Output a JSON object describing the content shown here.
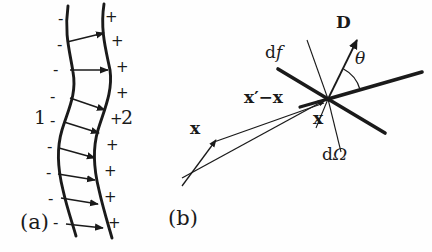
{
  "figure": {
    "background_color": "#fefefe",
    "ink_color": "#1a1a1a",
    "panels": [
      {
        "tag": "(a)",
        "description": "wavy-interface-with-polarization-arrows",
        "left_region_label": "1",
        "right_region_label": "2",
        "left_signs": [
          "-",
          "-",
          "-",
          "-",
          "-",
          "-",
          "-",
          "-",
          "-"
        ],
        "right_signs": [
          "+",
          "+",
          "+",
          "+",
          "+",
          "+",
          "+",
          "+",
          "+"
        ]
      },
      {
        "tag": "(b)",
        "description": "scattering-geometry-at-a-point",
        "labels": {
          "D": "D",
          "theta": "θ",
          "df": "d",
          "df_italic": "f",
          "dOmega": "d",
          "dOmega_sym": "Ω",
          "x_prime_minus_x": "x′−x",
          "x_at_point": "x",
          "x_source": "x"
        }
      }
    ]
  },
  "panel_a": {
    "tag": "(a)",
    "region_left": "1",
    "region_right": "2",
    "minus_sign": "-",
    "plus_sign": "+",
    "minus_positions": [
      {
        "x": 58,
        "y": 12
      },
      {
        "x": 57,
        "y": 38
      },
      {
        "x": 53,
        "y": 63
      },
      {
        "x": 50,
        "y": 90
      },
      {
        "x": 50,
        "y": 114
      },
      {
        "x": 47,
        "y": 140
      },
      {
        "x": 46,
        "y": 166
      },
      {
        "x": 48,
        "y": 192
      },
      {
        "x": 53,
        "y": 216
      }
    ],
    "plus_positions": [
      {
        "x": 105,
        "y": 10
      },
      {
        "x": 111,
        "y": 34
      },
      {
        "x": 116,
        "y": 60
      },
      {
        "x": 116,
        "y": 86
      },
      {
        "x": 110,
        "y": 112
      },
      {
        "x": 106,
        "y": 138
      },
      {
        "x": 104,
        "y": 164
      },
      {
        "x": 104,
        "y": 190
      },
      {
        "x": 108,
        "y": 216
      }
    ],
    "num1_position": {
      "x": 34,
      "y": 108
    },
    "num2_position": {
      "x": 121,
      "y": 108
    },
    "tag_position": {
      "x": 20,
      "y": 212
    }
  },
  "panel_b": {
    "tag": "(b)",
    "tag_position": {
      "x": 168,
      "y": 208
    },
    "vertex": {
      "x": 328,
      "y": 99
    },
    "label_D": "D",
    "label_D_position": {
      "x": 336,
      "y": 14
    },
    "label_theta": "θ",
    "label_theta_position": {
      "x": 355,
      "y": 50
    },
    "label_df_d": "d",
    "label_df_f": "f",
    "label_df_position": {
      "x": 265,
      "y": 44
    },
    "label_dOmega_d": "d",
    "label_dOmega_omega": "Ω",
    "label_dOmega_position": {
      "x": 322,
      "y": 146
    },
    "label_xprime_minus_x": "x′−x",
    "label_xprime_position": {
      "x": 244,
      "y": 89
    },
    "label_x_vertex": "x",
    "label_x_vertex_position": {
      "x": 313,
      "y": 110
    },
    "label_x_source": "x",
    "label_x_source_position": {
      "x": 190,
      "y": 120
    }
  }
}
